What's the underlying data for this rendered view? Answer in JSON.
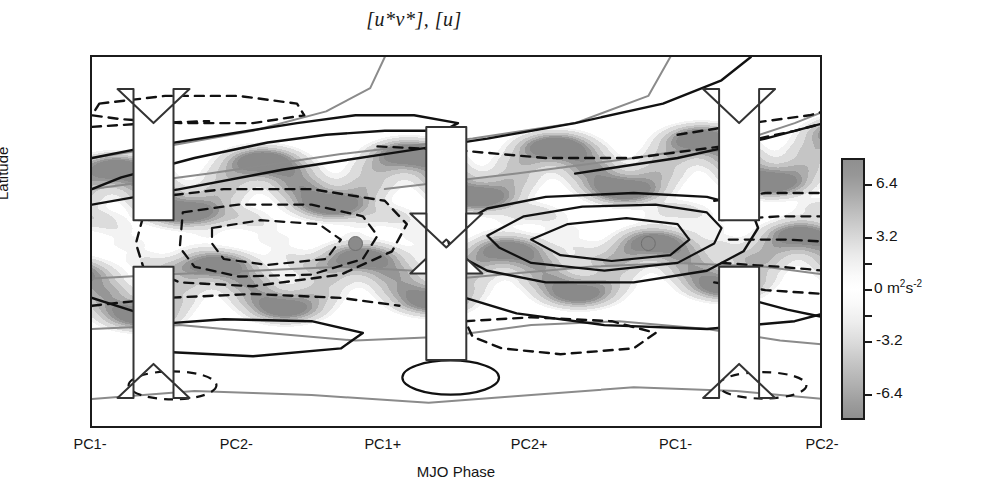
{
  "title": "[u*v*], [u]",
  "axes": {
    "ylabel": "Latitude",
    "xlabel": "MJO Phase",
    "yticks": [
      {
        "label": "30",
        "value": 30
      },
      {
        "label": "0",
        "value": 0
      },
      {
        "label": "-30",
        "value": -30
      }
    ],
    "xticks": [
      {
        "label": "PC1-",
        "index": 0
      },
      {
        "label": "PC2-",
        "index": 1
      },
      {
        "label": "PC1+",
        "index": 2
      },
      {
        "label": "PC2+",
        "index": 3
      },
      {
        "label": "PC1-",
        "index": 4
      },
      {
        "label": "PC2-",
        "index": 5
      }
    ]
  },
  "colorbar": {
    "unit_label": "0  m",
    "unit_sup1": "2",
    "unit_base": "s",
    "unit_sup2": "-2",
    "ticks": [
      {
        "label": "6.4",
        "value": 6.4
      },
      {
        "label": "3.2",
        "value": 3.2
      },
      {
        "label": "",
        "value": 1.6
      },
      {
        "label": "",
        "value": 0.0
      },
      {
        "label": "",
        "value": -1.6
      },
      {
        "label": "-3.2",
        "value": -3.2
      },
      {
        "label": "-6.4",
        "value": -6.4
      }
    ],
    "vmin": -8.0,
    "vmax": 8.0,
    "levels": [
      -8.0,
      -6.4,
      -4.8,
      -3.2,
      -1.6,
      0,
      1.6,
      3.2,
      4.8,
      6.4,
      8.0
    ]
  },
  "colors": {
    "frame": "#1b1b1b",
    "contour_solid": "#111111",
    "contour_dashed": "#111111",
    "contour_gray": "#8b8b8b",
    "arrow_fill": "#ffffff",
    "arrow_stroke": "#333333",
    "marker_fill": "#8a8a8a",
    "shade_dark": "#8f8f8f",
    "shade_light": "#ffffff"
  },
  "chart_data": {
    "type": "heatmap",
    "title": "[u*v*], [u]",
    "xlabel": "MJO Phase",
    "ylabel": "Latitude",
    "xlim": [
      0,
      5
    ],
    "ylim": [
      -48,
      48
    ],
    "grid": false,
    "legend": null,
    "shaded_field": {
      "name": "[u*v*] eddy momentum flux",
      "units": "m2 s-2",
      "cmap": "gray-symmetric",
      "vmin": -8.0,
      "vmax": 8.0,
      "description": "Grey shading: dark for large magnitude of either sign, white near zero. Two tilted bands of enhanced magnitude straddle the equator and slope poleward/eastward across the MJO phase axis, with strongest shading near 10-25 degrees latitude.",
      "maxima": [
        {
          "x": 0.25,
          "y": 18,
          "value": 5.6
        },
        {
          "x": 0.3,
          "y": -14,
          "value": 4.8
        },
        {
          "x": 1.55,
          "y": 12,
          "value": 4.2
        },
        {
          "x": 2.6,
          "y": 16,
          "value": 6.4
        },
        {
          "x": 2.7,
          "y": -18,
          "value": 4.4
        },
        {
          "x": 4.3,
          "y": 20,
          "value": 6.0
        },
        {
          "x": 4.45,
          "y": -16,
          "value": 5.2
        }
      ]
    },
    "contour_field": {
      "name": "[u] zonal-mean zonal wind anomaly",
      "solid": "positive anomaly",
      "dashed": "negative anomaly",
      "gray": "zero / reference isotach",
      "centers": [
        {
          "x": 0.65,
          "y": 34,
          "sign": "negative",
          "closed": true
        },
        {
          "x": 1.45,
          "y": 0,
          "sign": "negative",
          "closed": true
        },
        {
          "x": 3.35,
          "y": 2,
          "sign": "positive",
          "closed": true
        },
        {
          "x": 4.65,
          "y": 0,
          "sign": "negative",
          "closed": true
        },
        {
          "x": 0.95,
          "y": -24,
          "sign": "positive",
          "closed": true
        },
        {
          "x": 0.55,
          "y": -36,
          "sign": "negative",
          "closed": true
        },
        {
          "x": 2.65,
          "y": -26,
          "sign": "negative",
          "closed": true
        },
        {
          "x": 2.55,
          "y": -36,
          "sign": "positive",
          "closed": true
        },
        {
          "x": 4.55,
          "y": -36,
          "sign": "negative",
          "closed": true
        }
      ]
    },
    "markers": [
      {
        "x": 1.8,
        "y": 0,
        "shape": "circle",
        "color": "#8a8a8a"
      },
      {
        "x": 3.8,
        "y": 0,
        "shape": "circle",
        "color": "#8a8a8a"
      }
    ],
    "annotations": [
      {
        "type": "arrow-pair",
        "name": "divergence-left",
        "x": 0.42,
        "y": 0,
        "direction": "diverging"
      },
      {
        "type": "arrow-pair",
        "name": "convergence-center",
        "x": 2.42,
        "y": 0,
        "direction": "converging"
      },
      {
        "type": "arrow-pair",
        "name": "divergence-right",
        "x": 4.42,
        "y": 0,
        "direction": "diverging"
      }
    ]
  }
}
